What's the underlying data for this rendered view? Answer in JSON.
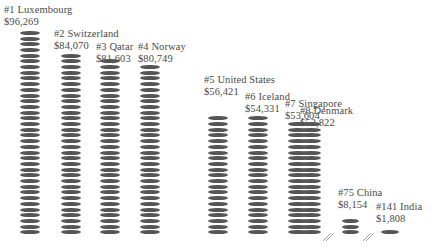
{
  "chart_data": {
    "type": "bar",
    "style": "pictogram-coin-stacks",
    "title": "",
    "xlabel": "",
    "ylabel": "",
    "categories": [
      "#1 Luxembourg",
      "#2 Switzerland",
      "#3 Qatar",
      "#4 Norway",
      "#5 United States",
      "#6 Iceland",
      "#7 Singapore",
      "#8 Denmark",
      "#75 China",
      "#141 India"
    ],
    "series": [
      {
        "name": "GDP per capita (USD)",
        "values": [
          96269,
          84070,
          81603,
          80749,
          56421,
          54331,
          53604,
          52822,
          8154,
          1808
        ]
      }
    ],
    "ranks": [
      1,
      2,
      3,
      4,
      5,
      6,
      7,
      8,
      75,
      141
    ],
    "countries": [
      "Luxembourg",
      "Switzerland",
      "Qatar",
      "Norway",
      "United States",
      "Iceland",
      "Singapore",
      "Denmark",
      "China",
      "India"
    ],
    "value_labels": [
      "$96,269",
      "$84,070",
      "$81,603",
      "$80,749",
      "$56,421",
      "$54,331",
      "$53,604",
      "$52,822",
      "$8,154",
      "$1,808"
    ],
    "axis_break_before": [
      "#75 China",
      "#141 India"
    ],
    "grid": false,
    "legend": "none"
  },
  "labels": [
    {
      "name": "#1 Luxembourg",
      "value": "$96,269"
    },
    {
      "name": "#2 Switzerland",
      "value": "$84,070"
    },
    {
      "name": "#3 Qatar",
      "value": "$81,603"
    },
    {
      "name": "#4 Norway",
      "value": "$80,749"
    },
    {
      "name": "#5 United States",
      "value": "$56,421"
    },
    {
      "name": "#6 Iceland",
      "value": "$54,331"
    },
    {
      "name": "#7 Singapore",
      "value": "$53,604"
    },
    {
      "name": "#8 Denmark",
      "value": "$52,822"
    },
    {
      "name": "#75 China",
      "value": "$8,154"
    },
    {
      "name": "#141 India",
      "value": "$1,808"
    }
  ],
  "colors": {
    "coin": "#555555",
    "text": "#4a4a4a",
    "background": "#ffffff"
  }
}
